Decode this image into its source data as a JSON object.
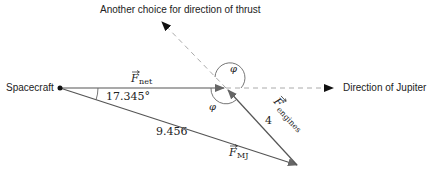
{
  "diagram": {
    "type": "vector-triangle",
    "labels": {
      "spacecraft": "Spacecraft",
      "thrust_alt": "Another choice for direction of thrust",
      "jupiter": "Direction of Jupiter",
      "fnet_symbol": "F",
      "fnet_sub": "net",
      "fmj_symbol": "F",
      "fmj_sub": "MJ",
      "feng_symbol": "F",
      "feng_sub": "engines",
      "angle_value": "17.345°",
      "fmj_magnitude": "9.456",
      "feng_magnitude": "4",
      "phi_upper": "φ",
      "phi_lower": "φ"
    },
    "colors": {
      "solid_line": "#555555",
      "dashed_line": "#aaaaaa",
      "arrow_head": "#111111",
      "text": "#222222"
    },
    "points": {
      "spacecraft": [
        60,
        88
      ],
      "junction": [
        226,
        88
      ],
      "mj_tip": [
        297,
        165
      ],
      "jupiter_arrow": [
        333,
        88
      ],
      "thrust_alt_tip": [
        162,
        22
      ]
    }
  }
}
